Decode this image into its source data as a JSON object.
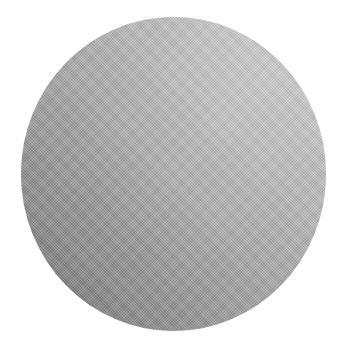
{
  "image": {
    "subject": "round gray woven mesh disc",
    "background_color": "#ffffff",
    "disc": {
      "shape": "circle",
      "texture": "fine woven mesh",
      "colors": {
        "highlight": "#cfcfcf",
        "mid": "#a6a6a6",
        "shadow": "#6a6a6a"
      }
    }
  }
}
